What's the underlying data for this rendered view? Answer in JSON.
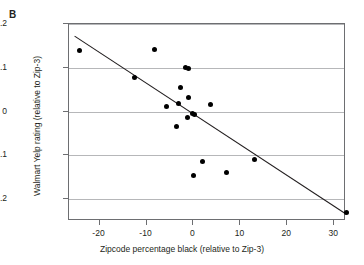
{
  "panel": {
    "label": "B"
  },
  "chart_data": {
    "type": "scatter",
    "title": "",
    "subtitle": "",
    "xlabel": "Zipcode percentage black (relative to Zip-3)",
    "ylabel": "Walmart Yelp rating (relative to Zip-3)",
    "xlim": [
      -26.5,
      32.5
    ],
    "ylim": [
      -0.25,
      0.2
    ],
    "xticks": [
      -20,
      -10,
      0,
      10,
      20,
      30
    ],
    "xtick_labels": [
      "-20",
      "-10",
      "0",
      "10",
      "20",
      "30"
    ],
    "yticks": [
      0.2,
      0.1,
      0,
      -0.1,
      -0.2
    ],
    "ytick_labels": [
      ".2",
      ".1",
      "0",
      "-.1",
      "-.2"
    ],
    "grid": "horizontal",
    "legend": "none",
    "marker_color": "#000000",
    "marker_size_px": 5,
    "points": [
      {
        "x": -24.2,
        "y": 0.139
      },
      {
        "x": -12.6,
        "y": 0.077
      },
      {
        "x": -8.2,
        "y": 0.141
      },
      {
        "x": -5.8,
        "y": 0.011
      },
      {
        "x": -3.6,
        "y": -0.034
      },
      {
        "x": -3.2,
        "y": 0.019
      },
      {
        "x": -2.8,
        "y": 0.056
      },
      {
        "x": -1.6,
        "y": 0.101
      },
      {
        "x": -1.1,
        "y": 0.099
      },
      {
        "x": -1.2,
        "y": -0.013
      },
      {
        "x": -1.0,
        "y": 0.032
      },
      {
        "x": -0.2,
        "y": -0.004
      },
      {
        "x": 0.2,
        "y": -0.006
      },
      {
        "x": 0.1,
        "y": -0.146
      },
      {
        "x": 2.0,
        "y": -0.114
      },
      {
        "x": 3.6,
        "y": 0.016
      },
      {
        "x": 7.0,
        "y": -0.139
      },
      {
        "x": 12.9,
        "y": -0.11
      },
      {
        "x": 32.7,
        "y": -0.231
      }
    ],
    "fit_line": {
      "type": "linear",
      "x_start": -25.3,
      "y_start": 0.172,
      "x_end": 33.0,
      "y_end": -0.239,
      "slope": -0.00705,
      "intercept": -0.0064,
      "color": "#231f20"
    }
  }
}
